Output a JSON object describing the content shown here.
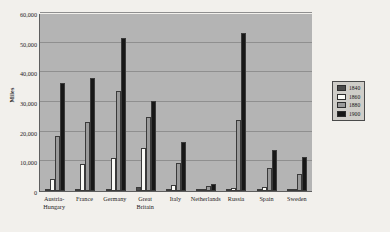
{
  "chart_data": {
    "type": "bar",
    "title": "",
    "xlabel": "",
    "ylabel": "Miles",
    "ylim": [
      0,
      60000
    ],
    "yticks": [
      "0",
      "10,000",
      "20,000",
      "30,000",
      "40,000",
      "50,000",
      "60,000"
    ],
    "ytick_values": [
      0,
      10000,
      20000,
      30000,
      40000,
      50000,
      60000
    ],
    "grid": true,
    "legend_position": "right",
    "categories": [
      "Austria-Hungary",
      "France",
      "Germany",
      "Great Britain",
      "Italy",
      "Netherlands",
      "Russia",
      "Spain",
      "Sweden"
    ],
    "category_lines": [
      [
        "Austria-",
        "Hungary"
      ],
      [
        "France"
      ],
      [
        "Germany"
      ],
      [
        "Great",
        "Britain"
      ],
      [
        "Italy"
      ],
      [
        "Netherlands"
      ],
      [
        "Russia"
      ],
      [
        "Spain"
      ],
      [
        "Sweden"
      ]
    ],
    "series": [
      {
        "name": "1840",
        "color": "#4a4a4a",
        "values": [
          100,
          300,
          350,
          1500,
          120,
          110,
          200,
          100,
          200
        ]
      },
      {
        "name": "1860",
        "color": "#fbfbf7",
        "values": [
          4200,
          9200,
          11100,
          14600,
          1900,
          200,
          1100,
          1200,
          400
        ]
      },
      {
        "name": "1880",
        "color": "#9a9a9a",
        "values": [
          18700,
          23400,
          33800,
          25100,
          9300,
          1800,
          23800,
          7600,
          5900
        ]
      },
      {
        "name": "1900",
        "color": "#171717",
        "values": [
          36300,
          38100,
          51700,
          30400,
          16400,
          2500,
          53200,
          13700,
          11400
        ]
      }
    ]
  },
  "legend": {
    "items": [
      {
        "label": "1840",
        "swatch": "#4a4a4a"
      },
      {
        "label": "1860",
        "swatch": "#fbfbf7"
      },
      {
        "label": "1880",
        "swatch": "#9a9a9a"
      },
      {
        "label": "1900",
        "swatch": "#171717"
      }
    ]
  }
}
